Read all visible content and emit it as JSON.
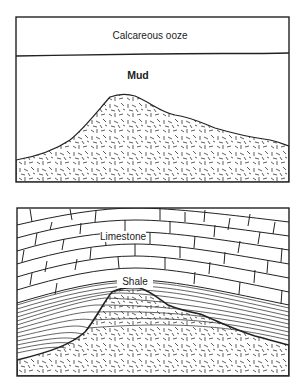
{
  "panels": [
    {
      "id": "top",
      "layers": {
        "ooze": "Calcareous ooze",
        "mud": "Mud"
      }
    },
    {
      "id": "bottom",
      "layers": {
        "limestone": "Limestone",
        "shale": "Shale"
      }
    }
  ],
  "colors": {
    "line": "#222222",
    "background": "#ffffff"
  }
}
